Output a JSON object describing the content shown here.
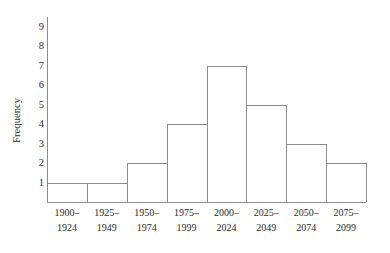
{
  "chart_data": {
    "type": "bar",
    "title": "",
    "subtitle": "",
    "xlabel": "",
    "ylabel": "Frequency",
    "grid": false,
    "legend": null,
    "categories": [
      "1900–1924",
      "1925–1949",
      "1950–1974",
      "1975–1999",
      "2000–2024",
      "2025–2049",
      "2050–2074",
      "2075–2099"
    ],
    "category_lines": [
      [
        "1900–",
        "1924"
      ],
      [
        "1925–",
        "1949"
      ],
      [
        "1950–",
        "1974"
      ],
      [
        "1975–",
        "1999"
      ],
      [
        "2000–",
        "2024"
      ],
      [
        "2025–",
        "2049"
      ],
      [
        "2050–",
        "2074"
      ],
      [
        "2075–",
        "2099"
      ]
    ],
    "values": [
      1,
      1,
      2,
      4,
      7,
      5,
      3,
      2
    ],
    "ylim": [
      0,
      9.5
    ],
    "yticks": [
      1,
      2,
      3,
      4,
      5,
      6,
      7,
      8,
      9
    ],
    "ytick_labels": [
      "1",
      "2",
      "3",
      "4",
      "5",
      "6",
      "7",
      "8",
      "9"
    ],
    "bar_style": {
      "fill": "none",
      "edge_color": "#8c8c8c",
      "gap": 0
    },
    "colors": {
      "background": "#ffffff",
      "axis": "#8c8c8c",
      "text": "#2b2b2b"
    },
    "total_frequency": 25
  },
  "axes": {
    "y_title": "Frequency"
  }
}
